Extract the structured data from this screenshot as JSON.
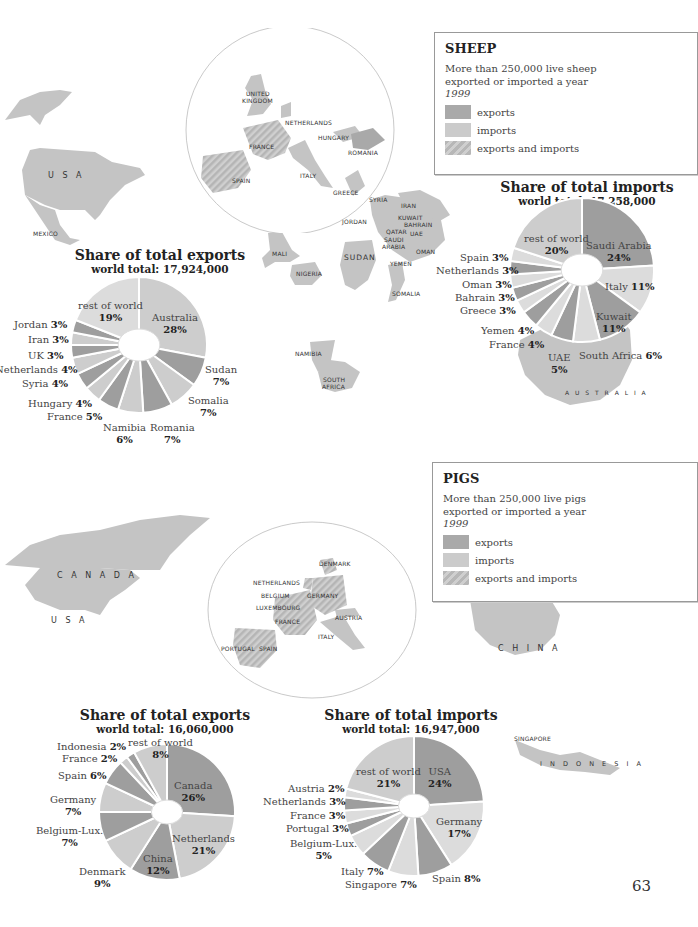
{
  "page_number": "63",
  "colors": {
    "export": "#9e9e9e",
    "import": "#cdcdcd",
    "both": "#b9b9b9",
    "rest": "#dcdcdc",
    "map_land": "#c4c4c4"
  },
  "sheep": {
    "legend": {
      "title": "SHEEP",
      "desc_line1": "More than 250,000 live sheep",
      "desc_line2": "exported or imported a year",
      "year": "1999",
      "items": [
        "exports",
        "imports",
        "exports and imports"
      ]
    },
    "map_labels": {
      "usa": "U S A",
      "mexico": "MEXICO",
      "uk1": "UNITED",
      "uk2": "KINGDOM",
      "netherlands": "NETHERLANDS",
      "hungary": "HUNGARY",
      "romania": "ROMANIA",
      "france": "FRANCE",
      "spain": "SPAIN",
      "italy": "ITALY",
      "greece": "GREECE",
      "syria": "SYRIA",
      "iran": "IRAN",
      "jordan": "JORDAN",
      "kuwait": "KUWAIT",
      "bahrain": "BAHRAIN",
      "qatar": "QATAR",
      "uae": "UAE",
      "saudi1": "SAUDI",
      "saudi2": "ARABIA",
      "oman": "OMAN",
      "yemen": "YEMEN",
      "mali": "MALI",
      "nigeria": "NIGERIA",
      "sudan": "SUDAN",
      "somalia": "SOMALIA",
      "namibia": "NAMIBIA",
      "sa1": "SOUTH",
      "sa2": "AFRICA",
      "australia": "A U S T R A L I A"
    },
    "exports_title": "Share of total exports",
    "exports_total": "world total: 17,924,000",
    "imports_title": "Share of total imports",
    "imports_total": "world total: 17,258,000"
  },
  "pigs": {
    "legend": {
      "title": "PIGS",
      "desc_line1": "More than 250,000 live pigs",
      "desc_line2": "exported or imported a year",
      "year": "1999",
      "items": [
        "exports",
        "imports",
        "exports and imports"
      ]
    },
    "map_labels": {
      "canada": "C A N A D A",
      "usa": "U S A",
      "denmark": "DENMARK",
      "netherlands": "NETHERLANDS",
      "belgium": "BELGIUM",
      "germany": "GERMANY",
      "luxembourg": "LUXEMBOURG",
      "austria": "AUSTRIA",
      "france": "FRANCE",
      "italy": "ITALY",
      "portugal": "PORTUGAL",
      "spain": "SPAIN",
      "china": "C H I N A",
      "singapore": "SINGAPORE",
      "indonesia": "I N D O N E S I A"
    },
    "exports_title": "Share of total exports",
    "exports_total": "world total: 16,060,000",
    "imports_title": "Share of total imports",
    "imports_total": "world total: 16,947,000"
  },
  "chart_data": [
    {
      "type": "pie",
      "title": "Sheep – Share of total exports",
      "subtitle": "world total: 17,924,000",
      "categories": [
        "Australia",
        "Sudan",
        "Somalia",
        "Romania",
        "Namibia",
        "France",
        "Hungary",
        "Syria",
        "Netherlands",
        "UK",
        "Iran",
        "Jordan",
        "rest of world"
      ],
      "values": [
        28,
        7,
        7,
        7,
        6,
        5,
        4,
        4,
        4,
        3,
        3,
        3,
        19
      ],
      "shading": [
        "import",
        "export",
        "import",
        "export",
        "import",
        "export",
        "import",
        "export",
        "import",
        "export",
        "import",
        "export",
        "rest"
      ]
    },
    {
      "type": "pie",
      "title": "Sheep – Share of total imports",
      "subtitle": "world total: 17,258,000",
      "categories": [
        "Saudi Arabia",
        "Italy",
        "Kuwait",
        "South Africa",
        "UAE",
        "France",
        "Yemen",
        "Greece",
        "Bahrain",
        "Oman",
        "Netherlands",
        "Spain",
        "rest of world"
      ],
      "values": [
        24,
        11,
        11,
        6,
        5,
        4,
        4,
        3,
        3,
        3,
        3,
        3,
        20
      ],
      "shading": [
        "export",
        "rest",
        "export",
        "rest",
        "export",
        "rest",
        "export",
        "rest",
        "export",
        "rest",
        "export",
        "rest",
        "import"
      ]
    },
    {
      "type": "pie",
      "title": "Pigs – Share of total exports",
      "subtitle": "world total: 16,060,000",
      "categories": [
        "Canada",
        "Netherlands",
        "China",
        "Denmark",
        "Belgium-Lux.",
        "Germany",
        "Spain",
        "France",
        "Indonesia",
        "rest of world"
      ],
      "values": [
        26,
        21,
        12,
        9,
        7,
        7,
        6,
        2,
        2,
        8
      ],
      "shading": [
        "export",
        "import",
        "export",
        "import",
        "export",
        "import",
        "export",
        "import",
        "export",
        "import"
      ]
    },
    {
      "type": "pie",
      "title": "Pigs – Share of total imports",
      "subtitle": "world total: 16,947,000",
      "categories": [
        "USA",
        "Germany",
        "Spain",
        "Singapore",
        "Italy",
        "Belgium-Lux.",
        "Portugal",
        "France",
        "Netherlands",
        "Austria",
        "rest of world"
      ],
      "values": [
        24,
        17,
        8,
        7,
        7,
        5,
        3,
        3,
        3,
        2,
        21
      ],
      "shading": [
        "export",
        "rest",
        "export",
        "rest",
        "export",
        "rest",
        "export",
        "rest",
        "export",
        "rest",
        "import"
      ]
    }
  ],
  "pie_labels": {
    "sheep_exports": [
      {
        "name": "Australia",
        "pct": "28%"
      },
      {
        "name": "Sudan",
        "pct": "7%"
      },
      {
        "name": "Somalia",
        "pct": "7%"
      },
      {
        "name": "Romania",
        "pct": "7%"
      },
      {
        "name": "Namibia",
        "pct": "6%"
      },
      {
        "name": "France",
        "pct": "5%"
      },
      {
        "name": "Hungary",
        "pct": "4%"
      },
      {
        "name": "Syria",
        "pct": "4%"
      },
      {
        "name": "Netherlands",
        "pct": "4%"
      },
      {
        "name": "UK",
        "pct": "3%"
      },
      {
        "name": "Iran",
        "pct": "3%"
      },
      {
        "name": "Jordan",
        "pct": "3%"
      },
      {
        "name": "rest of world",
        "pct": "19%"
      }
    ],
    "sheep_imports": [
      {
        "name": "Saudi Arabia",
        "pct": "24%"
      },
      {
        "name": "Italy",
        "pct": "11%"
      },
      {
        "name": "Kuwait",
        "pct": "11%"
      },
      {
        "name": "South Africa",
        "pct": "6%"
      },
      {
        "name": "UAE",
        "pct": "5%"
      },
      {
        "name": "France",
        "pct": "4%"
      },
      {
        "name": "Yemen",
        "pct": "4%"
      },
      {
        "name": "Greece",
        "pct": "3%"
      },
      {
        "name": "Bahrain",
        "pct": "3%"
      },
      {
        "name": "Oman",
        "pct": "3%"
      },
      {
        "name": "Netherlands",
        "pct": "3%"
      },
      {
        "name": "Spain",
        "pct": "3%"
      },
      {
        "name": "rest of world",
        "pct": "20%"
      }
    ],
    "pig_exports": [
      {
        "name": "Canada",
        "pct": "26%"
      },
      {
        "name": "Netherlands",
        "pct": "21%"
      },
      {
        "name": "China",
        "pct": "12%"
      },
      {
        "name": "Denmark",
        "pct": "9%"
      },
      {
        "name": "Belgium-Lux.",
        "pct": "7%"
      },
      {
        "name": "Germany",
        "pct": "7%"
      },
      {
        "name": "Spain",
        "pct": "6%"
      },
      {
        "name": "France",
        "pct": "2%"
      },
      {
        "name": "Indonesia",
        "pct": "2%"
      },
      {
        "name": "rest of world",
        "pct": "8%"
      }
    ],
    "pig_imports": [
      {
        "name": "USA",
        "pct": "24%"
      },
      {
        "name": "Germany",
        "pct": "17%"
      },
      {
        "name": "Spain",
        "pct": "8%"
      },
      {
        "name": "Singapore",
        "pct": "7%"
      },
      {
        "name": "Italy",
        "pct": "7%"
      },
      {
        "name": "Belgium-Lux.",
        "pct": "5%"
      },
      {
        "name": "Portugal",
        "pct": "3%"
      },
      {
        "name": "France",
        "pct": "3%"
      },
      {
        "name": "Netherlands",
        "pct": "3%"
      },
      {
        "name": "Austria",
        "pct": "2%"
      },
      {
        "name": "rest of world",
        "pct": "21%"
      }
    ]
  }
}
